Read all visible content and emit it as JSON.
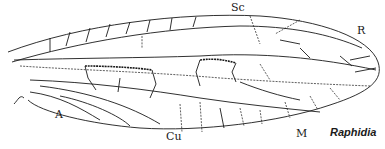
{
  "figure": {
    "species_label": "Raphidia",
    "vein_labels": {
      "sc": "Sc",
      "r": "R",
      "m": "M",
      "cu": "Cu",
      "a": "A"
    }
  }
}
